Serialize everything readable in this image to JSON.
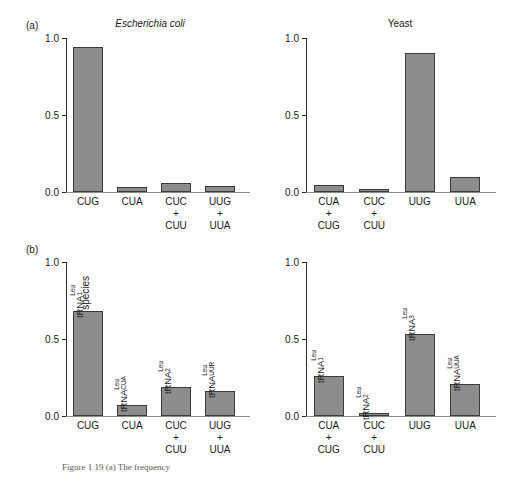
{
  "figure": {
    "caption": "Figure 1 19 (a) The frequency",
    "bar_color": "#8d8d8d",
    "bar_edge_color": "#3a3a3a",
    "axis_color": "#2b2b2b"
  },
  "panels": [
    {
      "tag": "(a)",
      "title": "Escherichia coli",
      "title_italic": true,
      "ylabel": "Frequency of codon usage",
      "yticks": [
        "0.0",
        "0.5",
        "1.0"
      ],
      "ytick_values": [
        0.0,
        0.5,
        1.0
      ],
      "categories": [
        "CUG",
        "CUA",
        "CUC\n+\nCUU",
        "UUG\n+\nUUA"
      ],
      "values": [
        0.94,
        0.03,
        0.06,
        0.04
      ],
      "bar_labels": []
    },
    {
      "tag": "",
      "title": "Yeast",
      "title_italic": false,
      "ylabel": "",
      "yticks": [
        "0.0",
        "0.5",
        "1.0"
      ],
      "ytick_values": [
        0.0,
        0.5,
        1.0
      ],
      "categories": [
        "CUA\n+\nCUG",
        "CUC\n+\nCUU",
        "UUG",
        "UUA"
      ],
      "values": [
        0.045,
        0.02,
        0.9,
        0.1
      ],
      "bar_labels": []
    },
    {
      "tag": "(b)",
      "title": "",
      "title_italic": false,
      "ylabel": "Frequency of tRNA species",
      "yticks": [
        "0.0",
        "0.5",
        "1.0"
      ],
      "ytick_values": [
        0.0,
        0.5,
        1.0
      ],
      "categories": [
        "CUG",
        "CUA",
        "CUC\n+\nCUU",
        "UUG\n+\nUUA"
      ],
      "values": [
        0.68,
        0.07,
        0.19,
        0.16
      ],
      "bar_labels": [
        {
          "base": "tRNA",
          "sub": "1",
          "sup": "Leu",
          "stacked": false
        },
        {
          "base": "tRNA",
          "sub": "CUA",
          "sup": "Leu",
          "stacked": true
        },
        {
          "base": "tRNA",
          "sub": "2",
          "sup": "Leu",
          "stacked": false
        },
        {
          "base": "tRNA",
          "sub": "UUR",
          "sup": "Leu",
          "stacked": true
        }
      ]
    },
    {
      "tag": "",
      "title": "",
      "title_italic": false,
      "ylabel": "",
      "yticks": [
        "0.0",
        "0.5",
        "1.0"
      ],
      "ytick_values": [
        0.0,
        0.5,
        1.0
      ],
      "categories": [
        "CUA\n+\nCUG",
        "CUC\n+\nCUU",
        "UUG",
        "UUA"
      ],
      "values": [
        0.26,
        0.02,
        0.53,
        0.21
      ],
      "bar_labels": [
        {
          "base": "tRNA",
          "sub": "1",
          "sup": "Leu",
          "stacked": false
        },
        {
          "base": "tRNA",
          "sub": "2",
          "sup": "Leu",
          "stacked": false
        },
        {
          "base": "tRNA",
          "sub": "3",
          "sup": "Leu",
          "stacked": false
        },
        {
          "base": "tRNA",
          "sub": "UUA",
          "sup": "Leu",
          "stacked": true
        }
      ]
    }
  ],
  "chart_data": [
    {
      "type": "bar",
      "title": "Escherichia coli",
      "panel": "(a) left",
      "xlabel": "",
      "ylabel": "Frequency of codon usage",
      "categories": [
        "CUG",
        "CUA",
        "CUC + CUU",
        "UUG + UUA"
      ],
      "values": [
        0.94,
        0.03,
        0.06,
        0.04
      ],
      "ylim": [
        0.0,
        1.0
      ],
      "ytick_labels": [
        "0.0",
        "0.5",
        "1.0"
      ],
      "grid": false,
      "legend": "none"
    },
    {
      "type": "bar",
      "title": "Yeast",
      "panel": "(a) right",
      "xlabel": "",
      "ylabel": "Frequency of codon usage",
      "categories": [
        "CUA + CUG",
        "CUC + CUU",
        "UUG",
        "UUA"
      ],
      "values": [
        0.045,
        0.02,
        0.9,
        0.1
      ],
      "ylim": [
        0.0,
        1.0
      ],
      "ytick_labels": [
        "0.0",
        "0.5",
        "1.0"
      ],
      "grid": false,
      "legend": "none"
    },
    {
      "type": "bar",
      "title": "Escherichia coli",
      "panel": "(b) left",
      "xlabel": "",
      "ylabel": "Frequency of tRNA species",
      "categories": [
        "CUG",
        "CUA",
        "CUC + CUU",
        "UUG + UUA"
      ],
      "values": [
        0.68,
        0.07,
        0.19,
        0.16
      ],
      "annotations": [
        "tRNA1Leu",
        "tRNACUALeu",
        "tRNA2Leu",
        "tRNAUURLeu"
      ],
      "ylim": [
        0.0,
        1.0
      ],
      "ytick_labels": [
        "0.0",
        "0.5",
        "1.0"
      ],
      "grid": false,
      "legend": "none"
    },
    {
      "type": "bar",
      "title": "Yeast",
      "panel": "(b) right",
      "xlabel": "",
      "ylabel": "Frequency of tRNA species",
      "categories": [
        "CUA + CUG",
        "CUC + CUU",
        "UUG",
        "UUA"
      ],
      "values": [
        0.26,
        0.02,
        0.53,
        0.21
      ],
      "annotations": [
        "tRNA1Leu",
        "tRNA2Leu",
        "tRNA3Leu",
        "tRNAUUALeu"
      ],
      "ylim": [
        0.0,
        1.0
      ],
      "ytick_labels": [
        "0.0",
        "0.5",
        "1.0"
      ],
      "grid": false,
      "legend": "none"
    }
  ]
}
